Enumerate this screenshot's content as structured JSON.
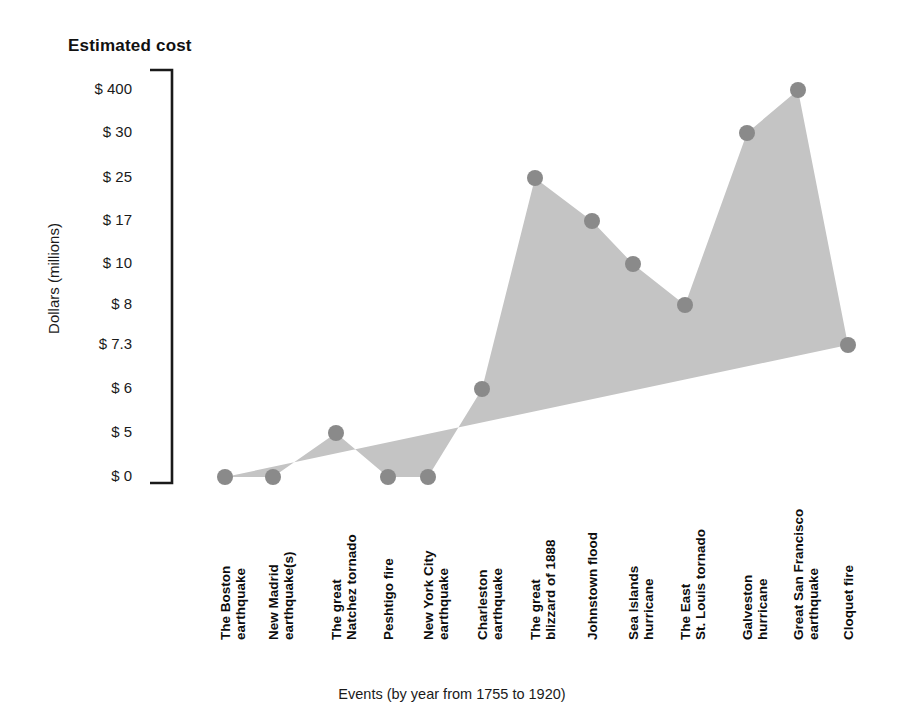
{
  "chart_title": "Estimated cost",
  "axes": {
    "y_title": "Dollars (millions)",
    "x_title": "Events (by year from 1755 to 1920)"
  },
  "colors": {
    "area_fill": "#c4c4c4",
    "marker": "#8a8a8a",
    "axis_line": "#1a1a1a",
    "text": "#1a1a1a",
    "background": "#ffffff"
  },
  "y_ticks": [
    {
      "label": "$ 400",
      "y": 90
    },
    {
      "label": "$ 30",
      "y": 133
    },
    {
      "label": "$ 25",
      "y": 178
    },
    {
      "label": "$ 17",
      "y": 221
    },
    {
      "label": "$ 10",
      "y": 264
    },
    {
      "label": "$ 8",
      "y": 305
    },
    {
      "label": "$ 7.3",
      "y": 345
    },
    {
      "label": "$ 6",
      "y": 389
    },
    {
      "label": "$ 5",
      "y": 433
    },
    {
      "label": "$ 0",
      "y": 477
    }
  ],
  "x_labels": [
    {
      "line1": "The Boston",
      "line2": "earthquake",
      "x": 225
    },
    {
      "line1": "New Madrid",
      "line2": "earthquake(s)",
      "x": 273
    },
    {
      "line1": "The great",
      "line2": "Natchez tornado",
      "x": 336
    },
    {
      "line1": "Peshtigo fire",
      "line2": "",
      "x": 388
    },
    {
      "line1": "New York City",
      "line2": "earthquake",
      "x": 428
    },
    {
      "line1": "Charleston",
      "line2": "earthquake",
      "x": 482
    },
    {
      "line1": "The great",
      "line2": "blizzard of 1888",
      "x": 535
    },
    {
      "line1": "Johnstown flood",
      "line2": "",
      "x": 592
    },
    {
      "line1": "Sea Islands",
      "line2": "hurricane",
      "x": 633
    },
    {
      "line1": "The East",
      "line2": "St. Louis tornado",
      "x": 685
    },
    {
      "line1": "Galveston",
      "line2": "hurricane",
      "x": 747
    },
    {
      "line1": "Great San Francisco",
      "line2": "earthquake",
      "x": 798
    },
    {
      "line1": "Cloquet fire",
      "line2": "",
      "x": 848
    }
  ],
  "chart_data": {
    "type": "area",
    "title": "Estimated cost",
    "xlabel": "Events (by year from 1755 to 1920)",
    "ylabel": "Dollars (millions)",
    "grid": false,
    "legend": "none",
    "y_axis_type": "categorical-ordinal (non-linear tick spacing)",
    "y_tick_labels": [
      "$ 400",
      "$ 30",
      "$ 25",
      "$ 17",
      "$ 10",
      "$ 8",
      "$ 7.3",
      "$ 6",
      "$ 5",
      "$ 0"
    ],
    "categories": [
      "The Boston earthquake",
      "New Madrid earthquake(s)",
      "The great Natchez tornado",
      "Peshtigo fire",
      "New York City earthquake",
      "Charleston earthquake",
      "The great blizzard of 1888",
      "Johnstown flood",
      "Sea Islands hurricane",
      "The East St. Louis tornado",
      "Galveston hurricane",
      "Great San Francisco earthquake",
      "Cloquet fire"
    ],
    "values": [
      0,
      0,
      5,
      0,
      0,
      6,
      25,
      17,
      10,
      8,
      30,
      400,
      7.3
    ],
    "value_labels": [
      "$ 0",
      "$ 0",
      "$ 5",
      "$ 0",
      "$ 0",
      "$ 6",
      "$ 25",
      "$ 17",
      "$ 10",
      "$ 8",
      "$ 30",
      "$ 400",
      "$ 7.3"
    ],
    "points_px": [
      {
        "x": 225,
        "y": 477
      },
      {
        "x": 273,
        "y": 477
      },
      {
        "x": 336,
        "y": 433
      },
      {
        "x": 388,
        "y": 477
      },
      {
        "x": 428,
        "y": 477
      },
      {
        "x": 482,
        "y": 389
      },
      {
        "x": 535,
        "y": 178
      },
      {
        "x": 592,
        "y": 221
      },
      {
        "x": 633,
        "y": 264
      },
      {
        "x": 685,
        "y": 305
      },
      {
        "x": 747,
        "y": 133
      },
      {
        "x": 798,
        "y": 90
      },
      {
        "x": 848,
        "y": 345
      }
    ]
  }
}
